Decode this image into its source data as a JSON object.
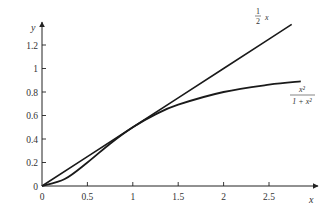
{
  "chart_data": {
    "type": "line",
    "title": "",
    "xlabel": "x",
    "ylabel": "y",
    "xlim": [
      0,
      3.05
    ],
    "ylim": [
      0,
      1.4
    ],
    "grid": false,
    "legend": "inline labels at line ends",
    "x_ticks": [
      "0",
      "0.5",
      "1",
      "1.5",
      "2",
      "2.5"
    ],
    "y_ticks": [
      "0",
      "0.2",
      "0.4",
      "0.6",
      "0.8",
      "1",
      "1.2"
    ],
    "series": [
      {
        "name": "½x",
        "label_num": "1",
        "label_den": "2",
        "label_var": "x",
        "x": [
          0,
          0.5,
          1,
          1.5,
          2,
          2.5,
          2.75
        ],
        "values": [
          0,
          0.25,
          0.5,
          0.75,
          1.0,
          1.25,
          1.375
        ]
      },
      {
        "name": "x²/(1 + x²)",
        "label_num": "x²",
        "label_den": "1 + x²",
        "x": [
          0,
          0.25,
          0.5,
          0.75,
          1,
          1.25,
          1.5,
          2,
          2.5,
          2.85
        ],
        "values": [
          0,
          0.059,
          0.2,
          0.36,
          0.5,
          0.61,
          0.692,
          0.8,
          0.862,
          0.89
        ]
      }
    ]
  }
}
